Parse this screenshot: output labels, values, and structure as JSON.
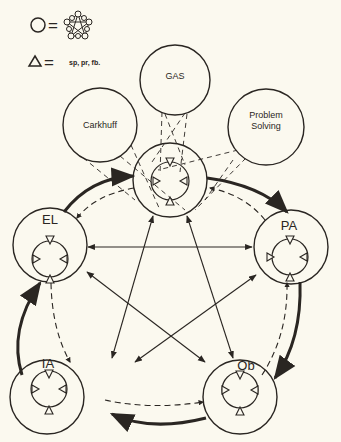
{
  "legend": {
    "circle_equals": "=",
    "network_icon": "pentagon-network",
    "triangle_equals": "=",
    "triangle_meaning": "sp, pr, fb."
  },
  "models": [
    {
      "id": "carkhuff",
      "label": "Carkhuff",
      "cx": 100,
      "cy": 125,
      "r": 37
    },
    {
      "id": "gas",
      "label": "GAS",
      "cx": 175,
      "cy": 80,
      "r": 35
    },
    {
      "id": "problem-solving",
      "label_line1": "Problem",
      "label_line2": "Solving",
      "cx": 266,
      "cy": 127,
      "r": 38
    }
  ],
  "nodes": [
    {
      "id": "center",
      "label": "",
      "cx": 170,
      "cy": 180
    },
    {
      "id": "el",
      "label": "EL",
      "cx": 50,
      "cy": 245
    },
    {
      "id": "pa",
      "label": "PA",
      "cx": 291,
      "cy": 247
    },
    {
      "id": "ia",
      "label": "IA",
      "cx": 47,
      "cy": 397
    },
    {
      "id": "ob",
      "label": "Ob",
      "cx": 240,
      "cy": 397
    }
  ],
  "colors": {
    "background": "#fbf9ef",
    "ink": "#2a2622"
  }
}
